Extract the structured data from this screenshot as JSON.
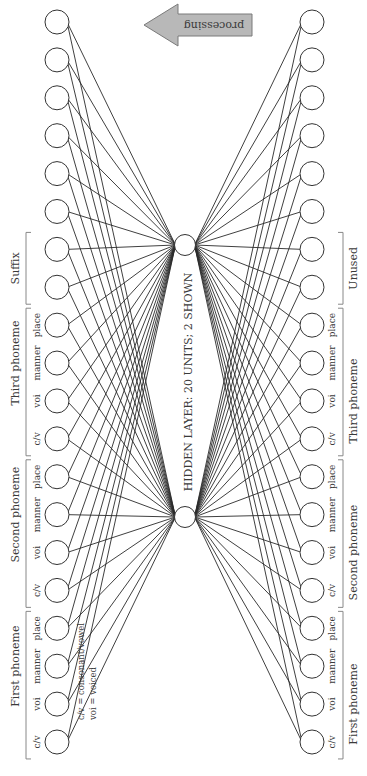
{
  "diagram": {
    "hidden_layer_label": "HIDDEN LAYER: 20 UNITS; 2 SHOWN",
    "arrow_label": "processing",
    "legend": {
      "line1": "c/v = consonant/vowel",
      "line2": "voi = voiced"
    },
    "colors": {
      "line": "#2a2a2a",
      "arrow_fill": "#b8b8b8",
      "arrow_stroke": "#7a7a7a",
      "bracket": "#888888"
    },
    "input_layer": {
      "groups": [
        {
          "label": "First phoneme",
          "units": [
            "c/v",
            "voi",
            "manner",
            "place"
          ]
        },
        {
          "label": "Second phoneme",
          "units": [
            "c/v",
            "voi",
            "manner",
            "place"
          ]
        },
        {
          "label": "Third phoneme",
          "units": [
            "c/v",
            "voi",
            "manner",
            "place"
          ]
        },
        {
          "label": "Suffix",
          "units": []
        }
      ]
    },
    "output_layer": {
      "groups": [
        {
          "label": "First phoneme",
          "units": [
            "c/v",
            "voi",
            "manner",
            "place"
          ]
        },
        {
          "label": "Second phoneme",
          "units": [
            "c/v",
            "voi",
            "manner",
            "place"
          ]
        },
        {
          "label": "Third phoneme",
          "units": [
            "c/v",
            "voi",
            "manner",
            "place"
          ]
        },
        {
          "label": "Unused",
          "units": []
        }
      ]
    },
    "unit_count_per_layer": 20,
    "hidden_units_shown": 2
  }
}
